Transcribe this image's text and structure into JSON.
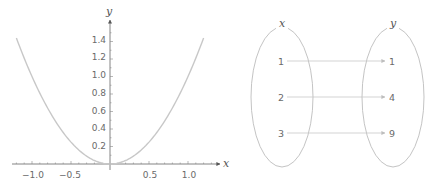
{
  "chart_data": {
    "type": "line",
    "title": "",
    "function": "y = x^2",
    "xlabel": "x",
    "ylabel": "y",
    "xlim": [
      -1.2,
      1.2
    ],
    "ylim": [
      0,
      1.5
    ],
    "x_ticks": [
      "-1.0",
      "-0.5",
      "0.5",
      "1.0"
    ],
    "y_ticks": [
      "0.2",
      "0.4",
      "0.6",
      "0.8",
      "1.0",
      "1.2",
      "1.4"
    ],
    "x": [
      -1.2,
      -1.0,
      -0.8,
      -0.6,
      -0.4,
      -0.2,
      0.0,
      0.2,
      0.4,
      0.6,
      0.8,
      1.0,
      1.2
    ],
    "series": [
      {
        "name": "y = x^2",
        "values": [
          1.44,
          1.0,
          0.64,
          0.36,
          0.16,
          0.04,
          0.0,
          0.04,
          0.16,
          0.36,
          0.64,
          1.0,
          1.44
        ]
      }
    ],
    "grid": false,
    "legend": "none",
    "curve_color": "#c8c8c8"
  },
  "plot": {
    "x_axis_label": "x",
    "y_axis_label": "y",
    "x_tick_labels": [
      "−1.0",
      "−0.5",
      "0.5",
      "1.0"
    ],
    "y_tick_labels": [
      "0.2",
      "0.4",
      "0.6",
      "0.8",
      "1.0",
      "1.2",
      "1.4"
    ]
  },
  "mapping": {
    "domain_label": "x",
    "codomain_label": "y",
    "domain_values": [
      "1",
      "2",
      "3"
    ],
    "codomain_values": [
      "1",
      "4",
      "9"
    ],
    "arrows": [
      {
        "from": "1",
        "to": "1"
      },
      {
        "from": "2",
        "to": "4"
      },
      {
        "from": "3",
        "to": "9"
      }
    ]
  }
}
